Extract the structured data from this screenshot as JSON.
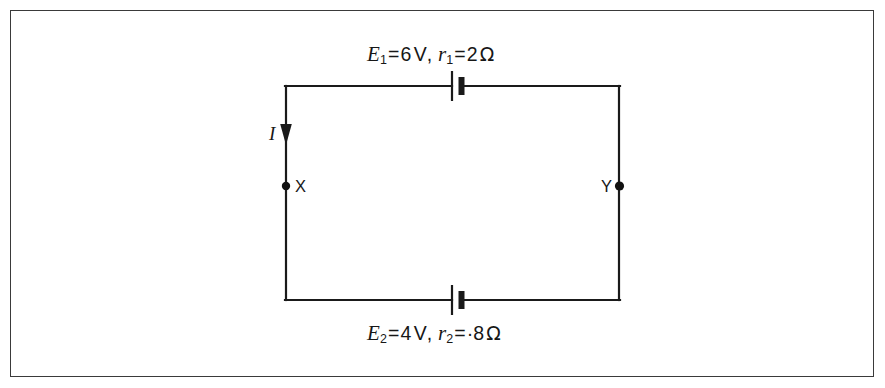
{
  "figure": {
    "kind": "circuit-diagram",
    "background_color": "#ffffff",
    "frame_color": "#3a3a3a",
    "wire_color": "#1a1a1a"
  },
  "labels": {
    "top_cell": {
      "emf_symbol": "E",
      "emf_subscript": "1",
      "equals": "=",
      "emf_value": "6",
      "emf_unit": "V",
      "comma": ",",
      "res_symbol": "r",
      "res_subscript": "1",
      "res_equals": "=",
      "res_value": "2",
      "res_unit": "Ω",
      "plain_text": "E₁ = 6 V, r₁ = 2 Ω"
    },
    "bottom_cell": {
      "emf_symbol": "E",
      "emf_subscript": "2",
      "equals": "=",
      "emf_value": "4",
      "emf_unit": "V",
      "comma": ",",
      "res_symbol": "r",
      "res_subscript": "2",
      "res_equals": "=",
      "res_value": "·8",
      "res_unit": "Ω",
      "plain_text": "E₂ = 4 V, r₂ = ·8 Ω"
    },
    "current": "I",
    "node_left": "X",
    "node_right": "Y"
  },
  "circuit": {
    "loop": {
      "left_x": 285,
      "right_x": 620,
      "top_y": 86,
      "bottom_y": 300,
      "stroke_width": 2.2
    },
    "current_arrow": {
      "x": 286,
      "from_y": 118,
      "to_y": 144,
      "direction": "down"
    },
    "nodes": [
      {
        "name": "X",
        "x": 286,
        "y": 186,
        "radius": 4.2,
        "label_side": "right"
      },
      {
        "name": "Y",
        "x": 620,
        "y": 186,
        "radius": 4.6,
        "label_side": "left"
      }
    ],
    "cells": [
      {
        "name": "top-cell",
        "x": 452,
        "y": 86,
        "long_plate_half_height": 15,
        "short_plate_half_height": 9,
        "short_plate_offset": 9,
        "short_plate_width": 6
      },
      {
        "name": "bottom-cell",
        "x": 452,
        "y": 300,
        "long_plate_half_height": 15,
        "short_plate_half_height": 9,
        "short_plate_offset": 9,
        "short_plate_width": 6
      }
    ]
  }
}
